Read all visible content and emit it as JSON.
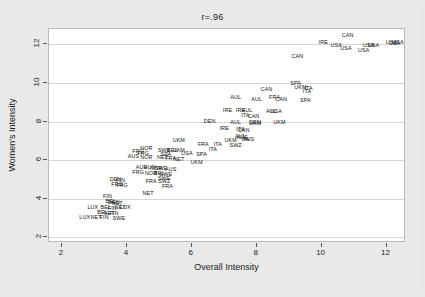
{
  "chart_data": {
    "type": "scatter",
    "title": "r=.96",
    "xlabel": "Overall Intensity",
    "ylabel": "Women's Intensity",
    "xlim": [
      1.6,
      12.6
    ],
    "ylim": [
      1.7,
      12.8
    ],
    "xticks": [
      2,
      4,
      6,
      8,
      10,
      12
    ],
    "yticks": [
      2,
      4,
      6,
      8,
      10,
      12
    ],
    "grid": "horizontal",
    "legend": "none",
    "correlation": 0.96,
    "marker_style": "country-code-text-label",
    "points": [
      {
        "label": "CAN",
        "x": 10.8,
        "y": 12.45
      },
      {
        "label": "IRE",
        "x": 10.05,
        "y": 12.1
      },
      {
        "label": "USA",
        "x": 12.15,
        "y": 12.1
      },
      {
        "label": "USA",
        "x": 12.35,
        "y": 12.1
      },
      {
        "label": "USA",
        "x": 12.25,
        "y": 12.0
      },
      {
        "label": "USA",
        "x": 10.45,
        "y": 11.9
      },
      {
        "label": "USA",
        "x": 11.45,
        "y": 11.9
      },
      {
        "label": "USA",
        "x": 11.6,
        "y": 11.9
      },
      {
        "label": "USA",
        "x": 10.75,
        "y": 11.75
      },
      {
        "label": "USA",
        "x": 11.3,
        "y": 11.65
      },
      {
        "label": "CAN",
        "x": 9.25,
        "y": 11.35
      },
      {
        "label": "SPA",
        "x": 9.2,
        "y": 9.95
      },
      {
        "label": "UKM",
        "x": 9.35,
        "y": 9.75
      },
      {
        "label": "ITA",
        "x": 9.6,
        "y": 9.7
      },
      {
        "label": "ITA",
        "x": 9.55,
        "y": 9.55
      },
      {
        "label": "CAN",
        "x": 8.3,
        "y": 9.65
      },
      {
        "label": "FRA",
        "x": 8.55,
        "y": 9.2
      },
      {
        "label": "AUL",
        "x": 7.35,
        "y": 9.2
      },
      {
        "label": "AUL",
        "x": 8.0,
        "y": 9.1
      },
      {
        "label": "CAN",
        "x": 8.75,
        "y": 9.1
      },
      {
        "label": "SPA",
        "x": 9.5,
        "y": 9.05
      },
      {
        "label": "IRE",
        "x": 7.1,
        "y": 8.55
      },
      {
        "label": "IRE",
        "x": 7.5,
        "y": 8.55
      },
      {
        "label": "AUL",
        "x": 7.7,
        "y": 8.55
      },
      {
        "label": "AUL",
        "x": 8.45,
        "y": 8.5
      },
      {
        "label": "USA",
        "x": 8.6,
        "y": 8.5
      },
      {
        "label": "ITA",
        "x": 7.65,
        "y": 8.3
      },
      {
        "label": "CAN",
        "x": 7.9,
        "y": 8.25
      },
      {
        "label": "DEN",
        "x": 6.55,
        "y": 8.0
      },
      {
        "label": "AUL",
        "x": 7.35,
        "y": 7.95
      },
      {
        "label": "DEN",
        "x": 7.95,
        "y": 7.95
      },
      {
        "label": "UKM",
        "x": 8.7,
        "y": 7.95
      },
      {
        "label": "UKM",
        "x": 7.95,
        "y": 7.9
      },
      {
        "label": "IRE",
        "x": 7.0,
        "y": 7.6
      },
      {
        "label": "ITA",
        "x": 7.5,
        "y": 7.55
      },
      {
        "label": "CAN",
        "x": 7.6,
        "y": 7.5
      },
      {
        "label": "AUS",
        "x": 7.55,
        "y": 7.15
      },
      {
        "label": "AUL",
        "x": 7.5,
        "y": 7.2
      },
      {
        "label": "AUS",
        "x": 7.75,
        "y": 7.05
      },
      {
        "label": "ITA",
        "x": 7.65,
        "y": 7.05
      },
      {
        "label": "UKM",
        "x": 7.2,
        "y": 7.0
      },
      {
        "label": "SWZ",
        "x": 7.35,
        "y": 6.75
      },
      {
        "label": "UKM",
        "x": 5.6,
        "y": 7.0
      },
      {
        "label": "FRA",
        "x": 6.35,
        "y": 6.8
      },
      {
        "label": "ITA",
        "x": 6.8,
        "y": 6.8
      },
      {
        "label": "NOR",
        "x": 4.6,
        "y": 6.6
      },
      {
        "label": "SWE",
        "x": 5.15,
        "y": 6.5
      },
      {
        "label": "BEL",
        "x": 5.4,
        "y": 6.5
      },
      {
        "label": "UKM",
        "x": 5.6,
        "y": 6.5
      },
      {
        "label": "ITA",
        "x": 6.65,
        "y": 6.55
      },
      {
        "label": "FRG",
        "x": 4.35,
        "y": 6.4
      },
      {
        "label": "FRG",
        "x": 4.5,
        "y": 6.3
      },
      {
        "label": "SPA",
        "x": 5.2,
        "y": 6.25
      },
      {
        "label": "USA",
        "x": 5.85,
        "y": 6.3
      },
      {
        "label": "SPA",
        "x": 6.3,
        "y": 6.25
      },
      {
        "label": "AUS",
        "x": 4.2,
        "y": 6.15
      },
      {
        "label": "NOR",
        "x": 4.6,
        "y": 6.1
      },
      {
        "label": "NET",
        "x": 5.1,
        "y": 6.1
      },
      {
        "label": "FRA",
        "x": 5.35,
        "y": 6.05
      },
      {
        "label": "NET",
        "x": 5.6,
        "y": 6.0
      },
      {
        "label": "UKM",
        "x": 6.15,
        "y": 5.85
      },
      {
        "label": "AUS",
        "x": 4.45,
        "y": 5.6
      },
      {
        "label": "HUN",
        "x": 4.7,
        "y": 5.6
      },
      {
        "label": "NOR",
        "x": 4.9,
        "y": 5.55
      },
      {
        "label": "SWE",
        "x": 5.05,
        "y": 5.55
      },
      {
        "label": "AUS",
        "x": 5.35,
        "y": 5.5
      },
      {
        "label": "FRG",
        "x": 4.35,
        "y": 5.35
      },
      {
        "label": "NOR",
        "x": 4.75,
        "y": 5.3
      },
      {
        "label": "BEL",
        "x": 5.0,
        "y": 5.3
      },
      {
        "label": "SWE",
        "x": 5.2,
        "y": 5.25
      },
      {
        "label": "DEN",
        "x": 3.65,
        "y": 4.95
      },
      {
        "label": "FIN",
        "x": 3.8,
        "y": 4.9
      },
      {
        "label": "SWE",
        "x": 5.15,
        "y": 5.0
      },
      {
        "label": "FRA",
        "x": 4.75,
        "y": 4.85
      },
      {
        "label": "SWZ",
        "x": 5.15,
        "y": 4.85
      },
      {
        "label": "FRG",
        "x": 3.7,
        "y": 4.7
      },
      {
        "label": "FRG",
        "x": 3.85,
        "y": 4.65
      },
      {
        "label": "FRA",
        "x": 5.25,
        "y": 4.6
      },
      {
        "label": "NET",
        "x": 4.65,
        "y": 4.25
      },
      {
        "label": "FIN",
        "x": 3.4,
        "y": 4.1
      },
      {
        "label": "BEL",
        "x": 3.5,
        "y": 3.85
      },
      {
        "label": "DEN",
        "x": 3.6,
        "y": 3.8
      },
      {
        "label": "NET",
        "x": 3.7,
        "y": 3.75
      },
      {
        "label": "LUX",
        "x": 2.95,
        "y": 3.5
      },
      {
        "label": "BEL",
        "x": 3.35,
        "y": 3.5
      },
      {
        "label": "FIN",
        "x": 3.55,
        "y": 3.45
      },
      {
        "label": "NET",
        "x": 3.8,
        "y": 3.5
      },
      {
        "label": "LUX",
        "x": 3.95,
        "y": 3.5
      },
      {
        "label": "BEL",
        "x": 3.25,
        "y": 3.25
      },
      {
        "label": "NET",
        "x": 3.45,
        "y": 3.2
      },
      {
        "label": "FIN",
        "x": 3.6,
        "y": 3.2
      },
      {
        "label": "LUX",
        "x": 2.7,
        "y": 3.0
      },
      {
        "label": "NET",
        "x": 3.05,
        "y": 3.0
      },
      {
        "label": "FIN",
        "x": 3.3,
        "y": 3.0
      },
      {
        "label": "SWE",
        "x": 3.75,
        "y": 2.95
      }
    ]
  },
  "axes": {
    "x_tick_labels": [
      "2",
      "4",
      "6",
      "8",
      "10",
      "12"
    ],
    "y_tick_labels": [
      "2",
      "4",
      "6",
      "8",
      "10",
      "12"
    ]
  },
  "style": {
    "figure_background": "#e8e8e8",
    "plot_background": "#ffffff",
    "gridline_color": "#d6d6d6",
    "text_color": "#111111",
    "frame_color": "#b9b9b9"
  }
}
